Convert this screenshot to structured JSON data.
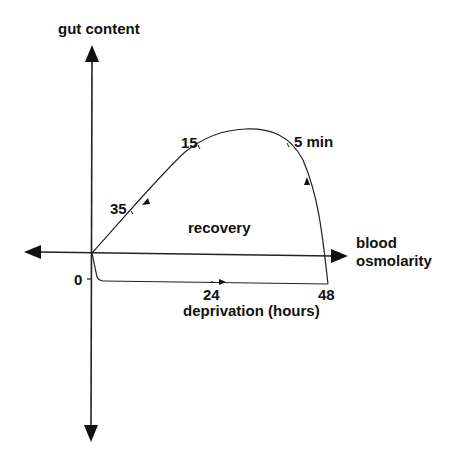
{
  "diagram": {
    "y_axis_label": "gut content",
    "x_axis_label_line1": "blood",
    "x_axis_label_line2": "osmolarity",
    "region_label": "recovery",
    "deprivation_label": "deprivation (hours)",
    "deprivation_ticks": [
      "0",
      "24",
      "48"
    ],
    "recovery_time_labels": [
      "5 min",
      "15",
      "35"
    ]
  },
  "colors": {
    "line": "#222222",
    "background": "#ffffff"
  }
}
